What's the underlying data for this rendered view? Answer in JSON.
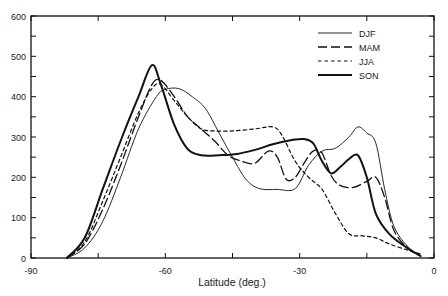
{
  "chart_data": {
    "type": "line",
    "title": "",
    "xlabel": "Latitude (deg.)",
    "ylabel": "",
    "xlim": [
      -90,
      0
    ],
    "ylim": [
      0,
      600
    ],
    "xticks": [
      -90,
      -60,
      -30,
      0
    ],
    "xtick_labels": [
      "-90",
      "-60",
      "-30",
      "0"
    ],
    "x_minor_ticks": [
      -75,
      -45,
      -15
    ],
    "yticks": [
      0,
      100,
      200,
      300,
      400,
      500,
      600
    ],
    "ytick_labels": [
      "0",
      "100",
      "200",
      "300",
      "400",
      "500",
      "600"
    ],
    "y_minor_ticks": [
      50,
      150,
      250,
      350,
      450,
      550
    ],
    "grid": false,
    "legend": "top-right",
    "series": [
      {
        "name": "DJF",
        "style": "thin-solid",
        "points": [
          [
            -82,
            0
          ],
          [
            -78,
            25
          ],
          [
            -74,
            90
          ],
          [
            -70,
            200
          ],
          [
            -66,
            320
          ],
          [
            -62,
            400
          ],
          [
            -60,
            418
          ],
          [
            -57,
            420
          ],
          [
            -54,
            400
          ],
          [
            -51,
            370
          ],
          [
            -48,
            310
          ],
          [
            -45,
            250
          ],
          [
            -42,
            195
          ],
          [
            -39,
            172
          ],
          [
            -35,
            170
          ],
          [
            -31,
            172
          ],
          [
            -28,
            230
          ],
          [
            -25,
            265
          ],
          [
            -22,
            272
          ],
          [
            -19,
            300
          ],
          [
            -17,
            325
          ],
          [
            -15,
            310
          ],
          [
            -13,
            285
          ],
          [
            -11,
            170
          ],
          [
            -9,
            80
          ],
          [
            -6,
            30
          ],
          [
            -3,
            5
          ]
        ]
      },
      {
        "name": "MAM",
        "style": "long-dash",
        "points": [
          [
            -82,
            0
          ],
          [
            -78,
            35
          ],
          [
            -74,
            120
          ],
          [
            -70,
            230
          ],
          [
            -66,
            350
          ],
          [
            -63,
            430
          ],
          [
            -61,
            440
          ],
          [
            -58,
            400
          ],
          [
            -55,
            350
          ],
          [
            -52,
            320
          ],
          [
            -49,
            290
          ],
          [
            -46,
            255
          ],
          [
            -43,
            240
          ],
          [
            -40,
            235
          ],
          [
            -37,
            265
          ],
          [
            -35,
            250
          ],
          [
            -33,
            195
          ],
          [
            -31,
            200
          ],
          [
            -29,
            235
          ],
          [
            -27,
            265
          ],
          [
            -25,
            260
          ],
          [
            -23,
            205
          ],
          [
            -21,
            180
          ],
          [
            -18,
            175
          ],
          [
            -15,
            190
          ],
          [
            -13,
            200
          ],
          [
            -11,
            150
          ],
          [
            -9,
            70
          ],
          [
            -6,
            25
          ],
          [
            -3,
            5
          ]
        ]
      },
      {
        "name": "JJA",
        "style": "short-dash",
        "points": [
          [
            -82,
            0
          ],
          [
            -78,
            40
          ],
          [
            -74,
            140
          ],
          [
            -70,
            250
          ],
          [
            -66,
            360
          ],
          [
            -63,
            420
          ],
          [
            -61,
            430
          ],
          [
            -58,
            390
          ],
          [
            -55,
            350
          ],
          [
            -52,
            320
          ],
          [
            -49,
            315
          ],
          [
            -45,
            315
          ],
          [
            -40,
            320
          ],
          [
            -36,
            325
          ],
          [
            -34,
            305
          ],
          [
            -31,
            240
          ],
          [
            -28,
            200
          ],
          [
            -25,
            170
          ],
          [
            -22,
            110
          ],
          [
            -19,
            60
          ],
          [
            -16,
            55
          ],
          [
            -13,
            50
          ],
          [
            -10,
            35
          ],
          [
            -6,
            20
          ],
          [
            -3,
            10
          ]
        ]
      },
      {
        "name": "SON",
        "style": "thick-solid",
        "points": [
          [
            -82,
            0
          ],
          [
            -78,
            50
          ],
          [
            -74,
            170
          ],
          [
            -70,
            290
          ],
          [
            -66,
            400
          ],
          [
            -63,
            478
          ],
          [
            -61,
            430
          ],
          [
            -58,
            330
          ],
          [
            -55,
            270
          ],
          [
            -52,
            255
          ],
          [
            -48,
            255
          ],
          [
            -44,
            258
          ],
          [
            -40,
            268
          ],
          [
            -36,
            282
          ],
          [
            -32,
            292
          ],
          [
            -29,
            295
          ],
          [
            -27,
            285
          ],
          [
            -25,
            240
          ],
          [
            -23,
            210
          ],
          [
            -21,
            225
          ],
          [
            -19,
            245
          ],
          [
            -17,
            255
          ],
          [
            -15,
            200
          ],
          [
            -13,
            110
          ],
          [
            -10,
            60
          ],
          [
            -6,
            25
          ],
          [
            -3,
            5
          ]
        ]
      }
    ]
  }
}
